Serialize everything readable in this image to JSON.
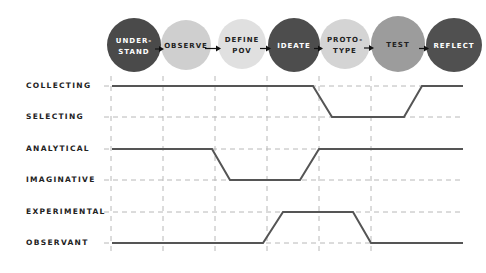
{
  "phases": [
    {
      "id": "understand",
      "lines": [
        "UNDER-",
        "STAND"
      ],
      "color": "#4a4a4a",
      "text_color": "#ffffff",
      "cx": 134,
      "cy": 45,
      "rx": 27,
      "ry": 27
    },
    {
      "id": "observe",
      "lines": [
        "OBSERVE"
      ],
      "color": "#cfcfcf",
      "text_color": "#222222",
      "cx": 186,
      "cy": 45,
      "rx": 25,
      "ry": 25
    },
    {
      "id": "define-pov",
      "lines": [
        "DEFINE",
        "POV"
      ],
      "color": "#e0e0e0",
      "text_color": "#222222",
      "cx": 242,
      "cy": 44,
      "rx": 24,
      "ry": 25
    },
    {
      "id": "ideate",
      "lines": [
        "IDEATE"
      ],
      "color": "#4d4d4d",
      "text_color": "#ffffff",
      "cx": 294,
      "cy": 45,
      "rx": 26,
      "ry": 27
    },
    {
      "id": "prototype",
      "lines": [
        "PROTO-",
        "TYPE"
      ],
      "color": "#d4d4d4",
      "text_color": "#222222",
      "cx": 345,
      "cy": 44,
      "rx": 25,
      "ry": 25
    },
    {
      "id": "test",
      "lines": [
        "TEST"
      ],
      "color": "#9c9c9c",
      "text_color": "#222222",
      "cx": 398,
      "cy": 44,
      "rx": 27,
      "ry": 28
    },
    {
      "id": "reflect",
      "lines": [
        "REFLECT"
      ],
      "color": "#505050",
      "text_color": "#ffffff",
      "cx": 454,
      "cy": 45,
      "rx": 28,
      "ry": 27
    }
  ],
  "rows": [
    {
      "label": "COLLECTING",
      "y": 86
    },
    {
      "label": "SELECTING",
      "y": 117
    },
    {
      "label": "ANALYTICAL",
      "y": 149
    },
    {
      "label": "IMAGINATIVE",
      "y": 180
    },
    {
      "label": "EXPERIMENTAL",
      "y": 212
    },
    {
      "label": "OBSERVANT",
      "y": 243
    }
  ],
  "grid": {
    "vertical_x": [
      111,
      163,
      215,
      267,
      319,
      371
    ],
    "x_start": 104,
    "x_end": 464,
    "color": "#b8b8b8"
  },
  "traces": [
    {
      "name": "collecting-selecting",
      "points": [
        [
          112,
          86
        ],
        [
          313,
          86
        ],
        [
          332,
          117
        ],
        [
          404,
          117
        ],
        [
          422,
          86
        ],
        [
          463,
          86
        ]
      ]
    },
    {
      "name": "analytical-imaginative",
      "points": [
        [
          112,
          149
        ],
        [
          212,
          149
        ],
        [
          230,
          180
        ],
        [
          300,
          180
        ],
        [
          319,
          149
        ],
        [
          463,
          149
        ]
      ]
    },
    {
      "name": "experimental-observant",
      "points": [
        [
          112,
          243
        ],
        [
          263,
          243
        ],
        [
          283,
          212
        ],
        [
          353,
          212
        ],
        [
          371,
          243
        ],
        [
          463,
          243
        ]
      ]
    }
  ],
  "trace_color": "#555555"
}
